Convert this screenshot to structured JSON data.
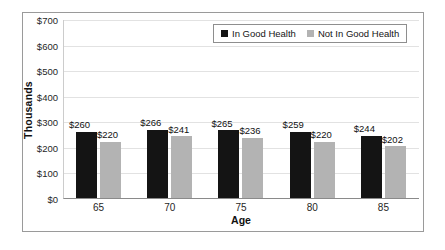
{
  "chart_data": {
    "type": "bar",
    "title": "",
    "xlabel": "Age",
    "ylabel": "Thousands",
    "categories": [
      "65",
      "70",
      "75",
      "80",
      "85"
    ],
    "ylim": [
      0,
      700
    ],
    "ytick_step": 100,
    "ytick_labels": [
      "$0",
      "$100",
      "$200",
      "$300",
      "$400",
      "$500",
      "$600",
      "$700"
    ],
    "ytick_values": [
      0,
      100,
      200,
      300,
      400,
      500,
      600,
      700
    ],
    "grid": true,
    "legend_position": "top-right",
    "series": [
      {
        "name": "In Good Health",
        "color": "#141414",
        "values": [
          260,
          266,
          265,
          259,
          244
        ],
        "labels": [
          "$260",
          "$266",
          "$265",
          "$259",
          "$244"
        ]
      },
      {
        "name": "Not In Good Health",
        "color": "#b3b3b3",
        "values": [
          220,
          241,
          236,
          220,
          202
        ],
        "labels": [
          "$220",
          "$241",
          "$236",
          "$220",
          "$202"
        ]
      }
    ]
  },
  "legend": {
    "items": [
      {
        "label": "In Good Health",
        "swatch": "black-square-icon"
      },
      {
        "label": "Not In Good Health",
        "swatch": "gray-square-icon"
      }
    ]
  }
}
